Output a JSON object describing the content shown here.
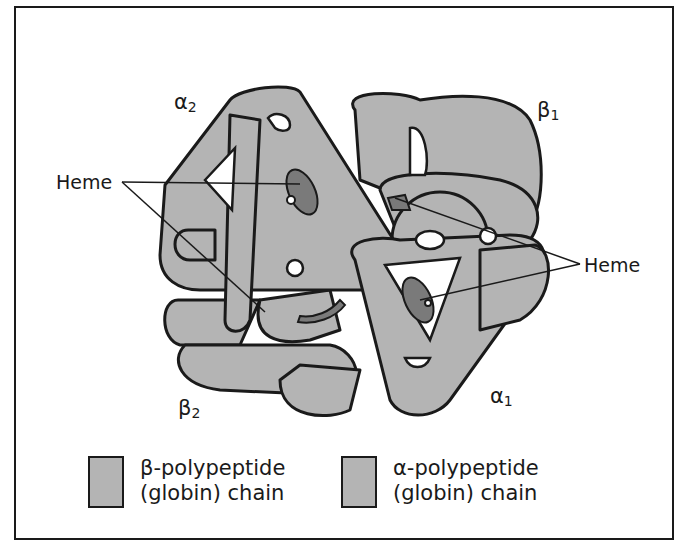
{
  "figure": {
    "colors": {
      "globin_fill": "#b4b4b4",
      "heme_fill": "#7a7a7a",
      "outline": "#1a1a1a",
      "background": "#ffffff"
    }
  },
  "labels": {
    "alpha2": {
      "symbol": "α",
      "sub": "2"
    },
    "beta1": {
      "symbol": "β",
      "sub": "1"
    },
    "beta2": {
      "symbol": "β",
      "sub": "2"
    },
    "alpha1": {
      "symbol": "α",
      "sub": "1"
    },
    "heme_left": "Heme",
    "heme_right": "Heme"
  },
  "legend": [
    {
      "line1": "β-polypeptide",
      "line2": "(globin) chain"
    },
    {
      "line1": "α-polypeptide",
      "line2": "(globin) chain"
    }
  ]
}
